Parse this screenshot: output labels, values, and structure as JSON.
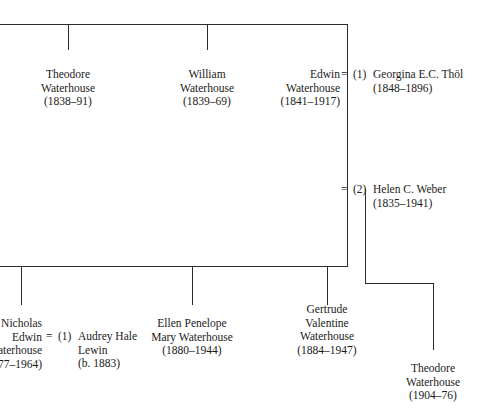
{
  "figure": {
    "kind": "family-tree",
    "note": "Genealogical descent chart of the Waterhouse family; left edge text is clipped by the page margin"
  },
  "generation1": {
    "children": [
      {
        "id": "theodore-1838",
        "lines": [
          "Theodore",
          "Waterhouse",
          "(1838–91)"
        ]
      },
      {
        "id": "william-1839",
        "lines": [
          "William",
          "Waterhouse",
          "(1839–69)"
        ]
      },
      {
        "id": "edwin-1841",
        "lines": [
          "Edwin",
          "Waterhouse",
          "(1841–1917)"
        ]
      }
    ]
  },
  "marriages": {
    "edwin_first": {
      "equals": "=",
      "ordinal": "(1)",
      "spouse_lines": [
        "Georgina E.C. Thöl",
        "(1848–1896)"
      ]
    },
    "edwin_second": {
      "equals": "=",
      "ordinal": "(2)",
      "spouse_lines": [
        "Helen C. Weber",
        "(1835–1941)"
      ]
    },
    "nicholas_first": {
      "equals": "=",
      "ordinal": "(1)",
      "spouse_lines": [
        "Audrey Hale",
        "Lewin",
        "(b. 1883)"
      ]
    }
  },
  "generation2": {
    "children": [
      {
        "id": "nicholas-edwin",
        "lines": [
          "Nicholas",
          "Edwin",
          "Waterhouse",
          "(1877–1964)"
        ]
      },
      {
        "id": "ellen-penelope",
        "lines": [
          "Ellen Penelope",
          "Mary Waterhouse",
          "(1880–1944)"
        ]
      },
      {
        "id": "gertrude-valentine",
        "lines": [
          "Gertrude",
          "Valentine",
          "Waterhouse",
          "(1884–1947)"
        ]
      },
      {
        "id": "theodore-1904",
        "lines": [
          "Theodore",
          "Waterhouse",
          "(1904–76)"
        ]
      }
    ]
  },
  "colors": {
    "ink": "#1a1a1a",
    "rule": "#2b2b2b",
    "page": "#ffffff"
  }
}
